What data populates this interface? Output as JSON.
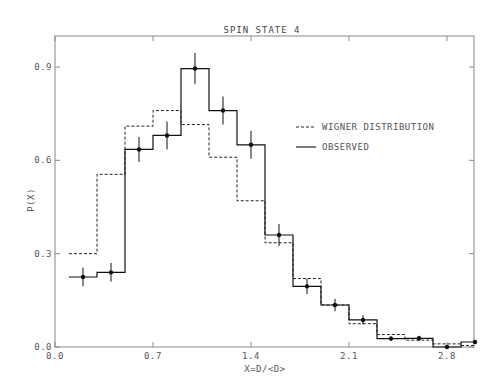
{
  "chart_data": {
    "type": "bar",
    "subtype": "step-histogram",
    "title": "SPIN STATE 4",
    "xlabel": "X=D/<D>",
    "ylabel": "P(X)",
    "xlim": [
      0.0,
      3.0
    ],
    "ylim": [
      0.0,
      1.0
    ],
    "x_ticks": [
      0.0,
      0.7,
      1.4,
      2.1,
      2.8
    ],
    "x_tick_labels": [
      "0.0",
      "0.7",
      "1.4",
      "2.1",
      "2.8"
    ],
    "y_ticks": [
      0.0,
      0.3,
      0.6,
      0.9
    ],
    "y_tick_labels": [
      "0.0",
      "0.3",
      "0.6",
      "0.9"
    ],
    "grid": false,
    "legend_position": "upper right (inside)",
    "bin_width": 0.2,
    "categories": [
      0.2,
      0.4,
      0.6,
      0.8,
      1.0,
      1.2,
      1.4,
      1.6,
      1.8,
      2.0,
      2.2,
      2.4,
      2.6,
      2.8,
      3.0
    ],
    "series": [
      {
        "name": "WIGNER DISTRIBUTION",
        "style": "dashed",
        "values": [
          0.3,
          0.555,
          0.71,
          0.76,
          0.715,
          0.61,
          0.47,
          0.335,
          0.22,
          0.135,
          0.075,
          0.04,
          0.022,
          0.01,
          0.005
        ]
      },
      {
        "name": "OBSERVED",
        "style": "solid",
        "markers": true,
        "values": [
          0.225,
          0.24,
          0.635,
          0.68,
          0.895,
          0.76,
          0.65,
          0.36,
          0.195,
          0.135,
          0.087,
          0.027,
          0.028,
          0.0,
          0.016
        ],
        "errors": [
          0.03,
          0.03,
          0.04,
          0.045,
          0.05,
          0.045,
          0.045,
          0.035,
          0.025,
          0.02,
          0.015,
          0.008,
          0.008,
          0.004,
          0.006
        ]
      }
    ]
  },
  "legend": {
    "wigner_label": "WIGNER DISTRIBUTION",
    "observed_label": "OBSERVED"
  }
}
